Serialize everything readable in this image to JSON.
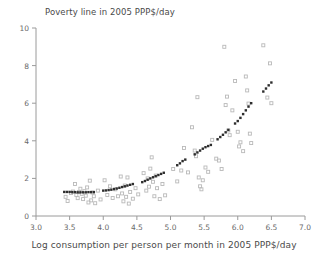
{
  "chart_data": {
    "type": "scatter",
    "title": "Poverty line in 2005 PPP$/day",
    "xlabel": "Log consumption per person per month in 2005 PPP$/day",
    "ylabel": "",
    "xlim": [
      3.0,
      7.0
    ],
    "ylim": [
      0,
      10
    ],
    "xticks": [
      3.0,
      3.5,
      4.0,
      4.5,
      5.0,
      5.5,
      6.0,
      6.5,
      7.0
    ],
    "xtick_labels": [
      "3.0",
      "3.5",
      "4.0",
      "4.5",
      "5.0",
      "5.5",
      "6.0",
      "6.5",
      "7.0"
    ],
    "yticks": [
      0,
      2,
      4,
      6,
      8,
      10
    ],
    "ytick_labels": [
      "0",
      "2",
      "4",
      "6",
      "8",
      "10"
    ],
    "grid": false,
    "legend": "none",
    "series": [
      {
        "name": "Observed poverty lines",
        "marker": "open-square",
        "color": "#b9b9b9",
        "points": [
          [
            3.44,
            1.02
          ],
          [
            3.47,
            0.8
          ],
          [
            3.52,
            1.22
          ],
          [
            3.55,
            1.3
          ],
          [
            3.58,
            1.7
          ],
          [
            3.6,
            1.12
          ],
          [
            3.62,
            0.95
          ],
          [
            3.64,
            1.28
          ],
          [
            3.66,
            1.45
          ],
          [
            3.68,
            1.18
          ],
          [
            3.7,
            0.9
          ],
          [
            3.72,
            1.32
          ],
          [
            3.74,
            1.08
          ],
          [
            3.76,
            1.52
          ],
          [
            3.78,
            0.72
          ],
          [
            3.8,
            1.88
          ],
          [
            3.82,
            0.83
          ],
          [
            3.84,
            1.25
          ],
          [
            3.86,
            1.05
          ],
          [
            3.88,
            0.68
          ],
          [
            3.92,
            1.35
          ],
          [
            3.96,
            0.88
          ],
          [
            4.02,
            1.9
          ],
          [
            4.06,
            1.12
          ],
          [
            4.1,
            1.58
          ],
          [
            4.14,
            0.96
          ],
          [
            4.18,
            1.42
          ],
          [
            4.22,
            1.05
          ],
          [
            4.26,
            2.1
          ],
          [
            4.28,
            1.2
          ],
          [
            4.3,
            0.78
          ],
          [
            4.32,
            1.62
          ],
          [
            4.34,
            1.02
          ],
          [
            4.36,
            2.05
          ],
          [
            4.38,
            0.66
          ],
          [
            4.4,
            1.28
          ],
          [
            4.44,
            0.92
          ],
          [
            4.48,
            1.48
          ],
          [
            4.52,
            1.15
          ],
          [
            4.6,
            2.28
          ],
          [
            4.64,
            1.35
          ],
          [
            4.66,
            2.0
          ],
          [
            4.68,
            1.56
          ],
          [
            4.7,
            2.52
          ],
          [
            4.72,
            3.12
          ],
          [
            4.74,
            1.82
          ],
          [
            4.76,
            1.05
          ],
          [
            4.78,
            2.15
          ],
          [
            4.8,
            1.48
          ],
          [
            4.84,
            0.9
          ],
          [
            4.88,
            1.7
          ],
          [
            4.92,
            1.1
          ],
          [
            5.04,
            2.5
          ],
          [
            5.1,
            1.84
          ],
          [
            5.16,
            2.42
          ],
          [
            5.2,
            3.62
          ],
          [
            5.26,
            2.32
          ],
          [
            5.32,
            4.72
          ],
          [
            5.36,
            3.48
          ],
          [
            5.38,
            3.18
          ],
          [
            5.4,
            6.32
          ],
          [
            5.42,
            2.05
          ],
          [
            5.44,
            1.58
          ],
          [
            5.46,
            1.42
          ],
          [
            5.48,
            1.9
          ],
          [
            5.52,
            2.58
          ],
          [
            5.56,
            2.35
          ],
          [
            5.62,
            4.05
          ],
          [
            5.68,
            3.05
          ],
          [
            5.72,
            2.95
          ],
          [
            5.76,
            2.5
          ],
          [
            5.8,
            9.0
          ],
          [
            5.82,
            5.9
          ],
          [
            5.84,
            6.35
          ],
          [
            5.86,
            4.55
          ],
          [
            5.88,
            4.3
          ],
          [
            5.92,
            5.62
          ],
          [
            5.96,
            7.18
          ],
          [
            6.0,
            4.48
          ],
          [
            6.02,
            3.7
          ],
          [
            6.04,
            3.92
          ],
          [
            6.08,
            3.45
          ],
          [
            6.12,
            7.42
          ],
          [
            6.14,
            6.68
          ],
          [
            6.16,
            5.98
          ],
          [
            6.18,
            4.38
          ],
          [
            6.2,
            3.88
          ],
          [
            6.38,
            9.08
          ],
          [
            6.44,
            6.3
          ],
          [
            6.48,
            8.12
          ],
          [
            6.5,
            6.0
          ]
        ]
      },
      {
        "name": "Fitted poverty line",
        "marker": "filled-square",
        "color": "#2d2d2d",
        "points": [
          [
            3.42,
            1.28
          ],
          [
            3.46,
            1.28
          ],
          [
            3.5,
            1.28
          ],
          [
            3.54,
            1.27
          ],
          [
            3.58,
            1.27
          ],
          [
            3.62,
            1.26
          ],
          [
            3.66,
            1.26
          ],
          [
            3.7,
            1.26
          ],
          [
            3.74,
            1.26
          ],
          [
            3.78,
            1.27
          ],
          [
            3.82,
            1.27
          ],
          [
            3.86,
            1.27
          ],
          [
            4.0,
            1.35
          ],
          [
            4.04,
            1.36
          ],
          [
            4.08,
            1.38
          ],
          [
            4.12,
            1.4
          ],
          [
            4.16,
            1.43
          ],
          [
            4.2,
            1.46
          ],
          [
            4.24,
            1.5
          ],
          [
            4.28,
            1.54
          ],
          [
            4.32,
            1.58
          ],
          [
            4.36,
            1.62
          ],
          [
            4.4,
            1.66
          ],
          [
            4.44,
            1.7
          ],
          [
            4.58,
            1.8
          ],
          [
            4.62,
            1.86
          ],
          [
            4.66,
            1.93
          ],
          [
            4.7,
            2.0
          ],
          [
            4.74,
            2.06
          ],
          [
            4.78,
            2.12
          ],
          [
            4.82,
            2.18
          ],
          [
            4.86,
            2.24
          ],
          [
            4.9,
            2.3
          ],
          [
            5.1,
            2.7
          ],
          [
            5.14,
            2.8
          ],
          [
            5.18,
            2.92
          ],
          [
            5.22,
            3.0
          ],
          [
            5.36,
            3.28
          ],
          [
            5.4,
            3.38
          ],
          [
            5.44,
            3.48
          ],
          [
            5.48,
            3.58
          ],
          [
            5.52,
            3.66
          ],
          [
            5.56,
            3.72
          ],
          [
            5.6,
            3.78
          ],
          [
            5.7,
            4.08
          ],
          [
            5.74,
            4.2
          ],
          [
            5.78,
            4.32
          ],
          [
            5.82,
            4.45
          ],
          [
            5.86,
            4.58
          ],
          [
            5.96,
            4.92
          ],
          [
            6.0,
            5.05
          ],
          [
            6.04,
            5.22
          ],
          [
            6.08,
            5.42
          ],
          [
            6.12,
            5.62
          ],
          [
            6.16,
            5.82
          ],
          [
            6.2,
            6.0
          ],
          [
            6.38,
            6.62
          ],
          [
            6.42,
            6.78
          ],
          [
            6.46,
            6.95
          ],
          [
            6.5,
            7.1
          ]
        ]
      }
    ]
  },
  "axes": {
    "axis_color": "#9a9a9a",
    "tick_color": "#9a9a9a",
    "label_color": "#4a4a4a"
  }
}
